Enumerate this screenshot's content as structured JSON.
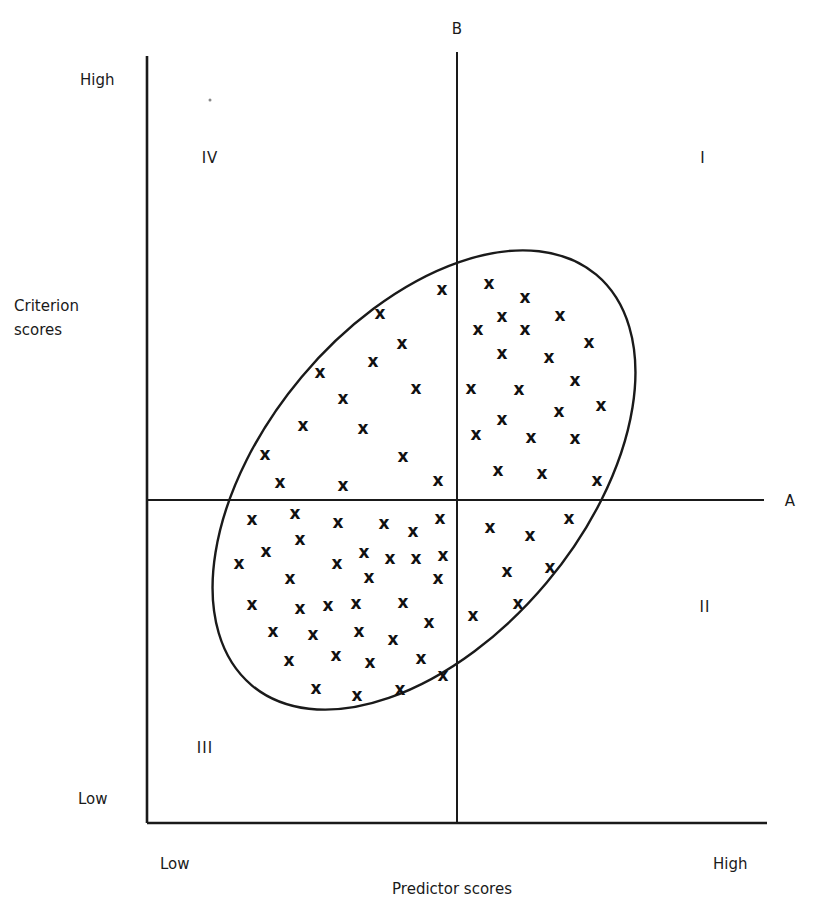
{
  "chart_data": {
    "type": "scatter",
    "title": "",
    "xlabel": "Predictor scores",
    "ylabel": "Criterion scores",
    "x_ticks": [
      "Low",
      "High"
    ],
    "y_ticks": [
      "High",
      "Low"
    ],
    "reference_lines": [
      {
        "name": "A",
        "orientation": "horizontal",
        "description": "criterion cutoff"
      },
      {
        "name": "B",
        "orientation": "vertical",
        "description": "predictor cutoff"
      }
    ],
    "quadrants": [
      {
        "label": "I",
        "position": "upper-right"
      },
      {
        "label": "II",
        "position": "lower-right"
      },
      {
        "label": "III",
        "position": "lower-left"
      },
      {
        "label": "IV",
        "position": "upper-left"
      }
    ],
    "marker": "x",
    "grid": false,
    "legend": null,
    "envelope": {
      "shape": "ellipse",
      "orientation": "positive correlation"
    },
    "point_counts": {
      "I": 21,
      "II": 7,
      "III": 35,
      "IV": 14
    },
    "points_pixel": {
      "quadrant_IV": [
        [
          442,
          289
        ],
        [
          380,
          313
        ],
        [
          402,
          343
        ],
        [
          373,
          361
        ],
        [
          320,
          372
        ],
        [
          416,
          388
        ],
        [
          343,
          398
        ],
        [
          303,
          425
        ],
        [
          363,
          428
        ],
        [
          265,
          454
        ],
        [
          403,
          456
        ],
        [
          280,
          482
        ],
        [
          343,
          485
        ],
        [
          438,
          480
        ]
      ],
      "quadrant_I": [
        [
          489,
          283
        ],
        [
          525,
          297
        ],
        [
          502,
          316
        ],
        [
          560,
          315
        ],
        [
          478,
          329
        ],
        [
          525,
          329
        ],
        [
          589,
          342
        ],
        [
          502,
          353
        ],
        [
          549,
          357
        ],
        [
          575,
          380
        ],
        [
          471,
          388
        ],
        [
          519,
          389
        ],
        [
          601,
          405
        ],
        [
          559,
          411
        ],
        [
          502,
          419
        ],
        [
          476,
          434
        ],
        [
          531,
          437
        ],
        [
          575,
          438
        ],
        [
          498,
          470
        ],
        [
          542,
          473
        ],
        [
          597,
          480
        ]
      ],
      "quadrant_III": [
        [
          252,
          519
        ],
        [
          295,
          513
        ],
        [
          338,
          522
        ],
        [
          384,
          523
        ],
        [
          413,
          531
        ],
        [
          440,
          518
        ],
        [
          300,
          539
        ],
        [
          266,
          551
        ],
        [
          364,
          552
        ],
        [
          239,
          563
        ],
        [
          337,
          563
        ],
        [
          390,
          558
        ],
        [
          416,
          558
        ],
        [
          443,
          555
        ],
        [
          290,
          578
        ],
        [
          369,
          577
        ],
        [
          438,
          578
        ],
        [
          252,
          604
        ],
        [
          300,
          608
        ],
        [
          328,
          605
        ],
        [
          356,
          603
        ],
        [
          403,
          602
        ],
        [
          429,
          622
        ],
        [
          273,
          631
        ],
        [
          313,
          634
        ],
        [
          359,
          631
        ],
        [
          393,
          639
        ],
        [
          289,
          660
        ],
        [
          336,
          655
        ],
        [
          370,
          662
        ],
        [
          421,
          658
        ],
        [
          443,
          675
        ],
        [
          316,
          688
        ],
        [
          357,
          695
        ],
        [
          400,
          689
        ]
      ],
      "quadrant_II": [
        [
          490,
          527
        ],
        [
          530,
          535
        ],
        [
          569,
          518
        ],
        [
          507,
          571
        ],
        [
          550,
          567
        ],
        [
          518,
          603
        ],
        [
          473,
          615
        ]
      ]
    }
  },
  "labels": {
    "line_a": "A",
    "line_b": "B",
    "y_high": "High",
    "y_low": "Low",
    "y_title_line1": "Criterion",
    "y_title_line2": "scores",
    "x_low": "Low",
    "x_high": "High",
    "x_title": "Predictor scores",
    "quad_I": "I",
    "quad_II": "II",
    "quad_III": "III",
    "quad_IV": "IV",
    "mark_glyph": "x"
  }
}
